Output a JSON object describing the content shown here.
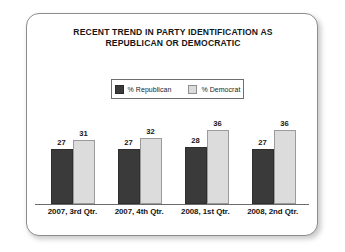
{
  "chart_data": {
    "type": "bar",
    "title": "RECENT TREND IN PARTY IDENTIFICATION AS REPUBLICAN OR DEMOCRATIC",
    "title_lines": [
      "RECENT TREND IN PARTY IDENTIFICATION AS",
      "REPUBLICAN OR DEMOCRATIC"
    ],
    "categories": [
      "2007, 3rd Qtr.",
      "2007, 4th Qtr.",
      "2008, 1st Qtr.",
      "2008, 2nd Qtr."
    ],
    "series": [
      {
        "name": "% Republican",
        "color": "#3a3a3a",
        "values": [
          27,
          27,
          28,
          27
        ]
      },
      {
        "name": "% Democrat",
        "color": "#dcdcdc",
        "values": [
          31,
          32,
          36,
          36
        ]
      }
    ],
    "xlabel": "",
    "ylabel": "",
    "ylim": [
      0,
      40
    ],
    "grid": false,
    "axis": "baseline-only",
    "legend_position": "top-center",
    "data_labels": true
  },
  "legend": {
    "items": [
      {
        "label": "% Republican",
        "swatch": "dark-square-swatch"
      },
      {
        "label": "% Democrat",
        "swatch": "light-square-swatch"
      }
    ]
  },
  "colors": {
    "republican": "#3a3a3a",
    "democrat": "#dcdcdc",
    "card_border": "#8d8d8d",
    "axis": "#6b6b6b",
    "text": "#151515",
    "background": "#ffffff"
  }
}
